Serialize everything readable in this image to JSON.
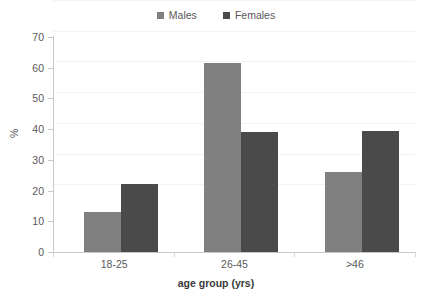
{
  "chart_data": {
    "type": "bar",
    "title": "",
    "subtitle": "",
    "xlabel": "age group (yrs)",
    "ylabel": "%",
    "categories": [
      "18-25",
      "26-45",
      ">46"
    ],
    "series": [
      {
        "name": "Males",
        "values": [
          13,
          61.5,
          26
        ],
        "color": "#808080"
      },
      {
        "name": "Females",
        "values": [
          22,
          39,
          39.5
        ],
        "color": "#4a4a4a"
      }
    ],
    "ylim": [
      0,
      70
    ],
    "ytick_step": 10,
    "yticks": [
      0,
      10,
      20,
      30,
      40,
      50,
      60,
      70
    ],
    "ytick_labels": [
      "0",
      "10",
      "20",
      "30",
      "40",
      "50",
      "60",
      "70"
    ],
    "grid": true,
    "grid_axis": "y",
    "legend_position": "top-center",
    "annotations": []
  },
  "legend": {
    "entries": [
      {
        "label": "Males",
        "swatch": "legend-swatch-males"
      },
      {
        "label": "Females",
        "swatch": "legend-swatch-females"
      }
    ]
  },
  "colors": {
    "males": "#808080",
    "females": "#4a4a4a",
    "axis": "#c9c9c9",
    "gridline": "#f2f2f2",
    "text": "#595959",
    "background": "#ffffff"
  }
}
